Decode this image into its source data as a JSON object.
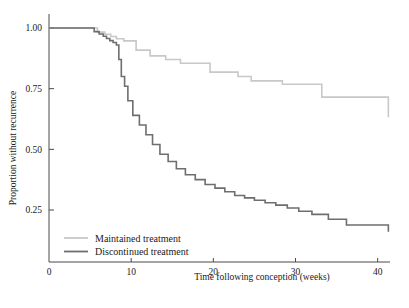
{
  "chart_data": {
    "type": "line",
    "title": "",
    "xlabel": "Time following conception (weeks)",
    "ylabel": "Proportion without recurrence",
    "xlim": [
      0,
      41.5
    ],
    "ylim": [
      0.1,
      1.02
    ],
    "xticks": [
      0,
      10,
      20,
      30,
      40
    ],
    "xtick_labels": [
      "0",
      "10",
      "20",
      "30",
      "40"
    ],
    "yticks": [
      0.25,
      0.5,
      0.75,
      1.0
    ],
    "ytick_labels": [
      "0.25",
      "0.50",
      "0.75",
      "1.00"
    ],
    "grid": false,
    "legend_position": "bottom-left",
    "step_style": "post",
    "colors": {
      "maintained": "#c8c8c8",
      "discontinued": "#6e6e6e",
      "axis": "#4a4a4a",
      "text": "#1a1a1a",
      "background": "#ffffff"
    },
    "series": [
      {
        "name": "Maintained treatment",
        "color": "#c8c8c8",
        "x": [
          0,
          5.0,
          5.9,
          6.8,
          7.5,
          8.2,
          9.1,
          10.6,
          12.3,
          14.2,
          16.0,
          19.6,
          23.0,
          24.6,
          28.4,
          33.2,
          41.3
        ],
        "y": [
          1.0,
          1.0,
          0.983,
          0.974,
          0.965,
          0.956,
          0.947,
          0.909,
          0.885,
          0.87,
          0.855,
          0.818,
          0.8,
          0.782,
          0.768,
          0.715,
          0.632
        ]
      },
      {
        "name": "Discontinued treatment",
        "color": "#6e6e6e",
        "x": [
          0,
          4.8,
          5.5,
          6.1,
          6.6,
          7.0,
          7.4,
          7.8,
          8.2,
          8.5,
          8.8,
          9.2,
          9.6,
          10.2,
          11.0,
          11.8,
          12.6,
          13.5,
          14.5,
          15.5,
          16.6,
          17.8,
          19.0,
          20.2,
          21.4,
          22.6,
          23.8,
          25.0,
          26.3,
          27.6,
          29.0,
          30.4,
          32.0,
          34.0,
          36.2,
          41.3
        ],
        "y": [
          1.0,
          1.0,
          0.985,
          0.975,
          0.966,
          0.957,
          0.948,
          0.94,
          0.93,
          0.87,
          0.8,
          0.76,
          0.7,
          0.64,
          0.6,
          0.56,
          0.52,
          0.48,
          0.45,
          0.42,
          0.395,
          0.375,
          0.355,
          0.34,
          0.325,
          0.31,
          0.3,
          0.29,
          0.28,
          0.27,
          0.258,
          0.245,
          0.232,
          0.212,
          0.188,
          0.16
        ]
      }
    ],
    "legend": [
      {
        "label": "Maintained treatment",
        "color": "#c8c8c8"
      },
      {
        "label": "Discontinued treatment",
        "color": "#6e6e6e"
      }
    ]
  }
}
